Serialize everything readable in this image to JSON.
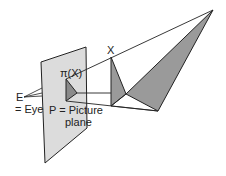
{
  "diagram": {
    "labels": {
      "eye_letter": "E",
      "eye_desc": "= Eye",
      "plane_line1": "P = Picture",
      "plane_line2": "plane",
      "projected_point": "π(X)",
      "object_point": "X"
    },
    "colors": {
      "plane_fill": "#dcdcdc",
      "object_fill": "#9a9a9a",
      "stroke": "#222222"
    }
  }
}
